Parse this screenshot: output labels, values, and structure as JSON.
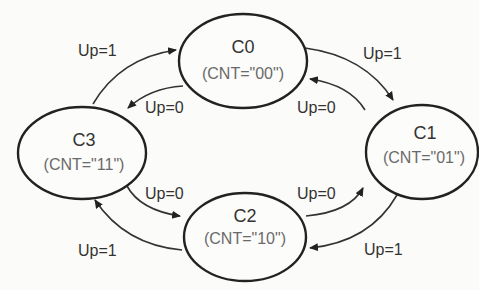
{
  "diagram": {
    "type": "state-machine",
    "states": [
      {
        "id": "C0",
        "name": "C0",
        "output": "(CNT=\"00\")"
      },
      {
        "id": "C1",
        "name": "C1",
        "output": "(CNT=\"01\")"
      },
      {
        "id": "C2",
        "name": "C2",
        "output": "(CNT=\"10\")"
      },
      {
        "id": "C3",
        "name": "C3",
        "output": "(CNT=\"11\")"
      }
    ],
    "transitions": [
      {
        "from": "C0",
        "to": "C1",
        "label": "Up=1"
      },
      {
        "from": "C1",
        "to": "C2",
        "label": "Up=1"
      },
      {
        "from": "C2",
        "to": "C3",
        "label": "Up=1"
      },
      {
        "from": "C3",
        "to": "C0",
        "label": "Up=1"
      },
      {
        "from": "C0",
        "to": "C3",
        "label": "Up=0"
      },
      {
        "from": "C3",
        "to": "C2",
        "label": "Up=0"
      },
      {
        "from": "C2",
        "to": "C1",
        "label": "Up=0"
      },
      {
        "from": "C1",
        "to": "C0",
        "label": "Up=0"
      }
    ],
    "colors": {
      "stroke": "#222222",
      "text": "#333333",
      "subtext": "#6a6a6a",
      "background": "#fbfbf9"
    }
  }
}
